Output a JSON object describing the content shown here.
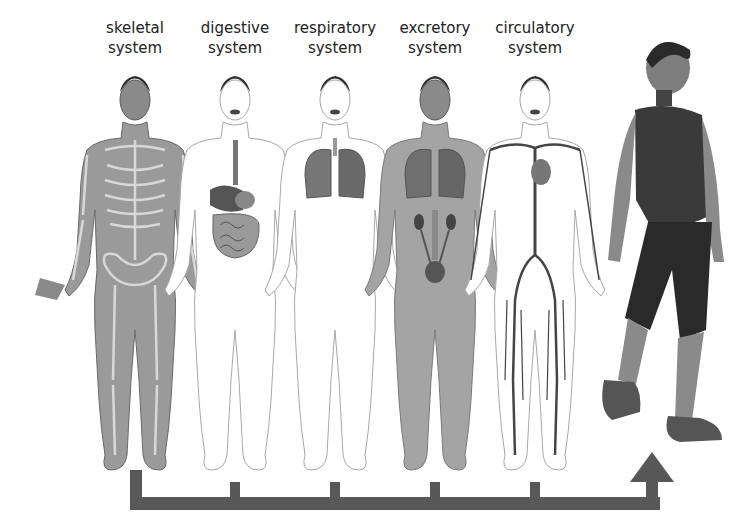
{
  "diagram": {
    "systems": [
      {
        "id": "skeletal",
        "line1": "skeletal",
        "line2": "system",
        "center_x": 135
      },
      {
        "id": "digestive",
        "line1": "digestive",
        "line2": "system",
        "center_x": 235
      },
      {
        "id": "respiratory",
        "line1": "respiratory",
        "line2": "system",
        "center_x": 335
      },
      {
        "id": "excretory",
        "line1": "excretory",
        "line2": "system",
        "center_x": 435
      },
      {
        "id": "circulatory",
        "line1": "circulatory",
        "line2": "system",
        "center_x": 535
      }
    ],
    "result_figure": "walking person",
    "colors": {
      "arrow": "#585858",
      "skin_dark": "#8a8a8a",
      "skin_outline": "#a8a8a8",
      "hair": "#2e2e2e",
      "organ": "#6e6e6e",
      "clothing": "#3a3a3a",
      "text": "#222222"
    }
  }
}
